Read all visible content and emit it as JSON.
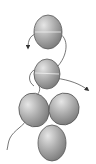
{
  "diagram": {
    "type": "beading-thread-path",
    "background": "#ffffff",
    "bead_color_light": "#d4d4d4",
    "bead_color_dark": "#808080",
    "bead_outline": "#5a5a5a",
    "thread_color": "#555555",
    "beads": [
      {
        "id": "bead-1",
        "cx": 48,
        "cy": 32,
        "rx": 14,
        "ry": 17
      },
      {
        "id": "bead-2",
        "cx": 47,
        "cy": 74,
        "rx": 13,
        "ry": 15
      },
      {
        "id": "bead-3",
        "cx": 34,
        "cy": 110,
        "rx": 15,
        "ry": 17
      },
      {
        "id": "bead-4",
        "cx": 64,
        "cy": 109,
        "rx": 15,
        "ry": 16
      },
      {
        "id": "bead-5",
        "cx": 52,
        "cy": 143,
        "rx": 14,
        "ry": 18
      }
    ]
  }
}
